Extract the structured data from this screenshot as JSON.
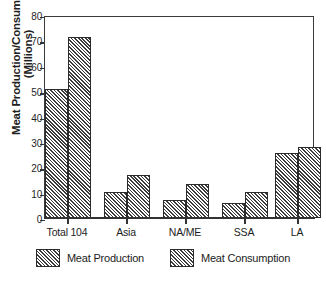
{
  "chart_data": {
    "type": "bar",
    "title": "Meat Production/Consumption (Million Metric Tons)",
    "xlabel": "",
    "ylabel_line1": "Meat Production/Consumption",
    "ylabel_line2": "(Millions)",
    "categories": [
      "Total 104",
      "Asia",
      "NA/ME",
      "SSA",
      "LA"
    ],
    "series": [
      {
        "name": "Meat Production",
        "values": [
          51.0,
          10.3,
          7.2,
          5.8,
          25.7
        ],
        "pattern": "diagonal-hatch",
        "color": "#3c3c3c"
      },
      {
        "name": "Meat Consumption",
        "values": [
          71.5,
          17.0,
          13.6,
          10.4,
          28.0
        ],
        "pattern": "diagonal-hatch",
        "color": "#3c3c3c"
      }
    ],
    "ylim": [
      0,
      80
    ],
    "yticks": [
      0,
      10,
      20,
      30,
      40,
      50,
      60,
      70,
      80
    ],
    "ytick_labels": [
      "0",
      "10",
      "20",
      "30",
      "40",
      "50",
      "60",
      "70",
      "80"
    ],
    "grid": false,
    "legend_position": "bottom",
    "frame": true
  }
}
